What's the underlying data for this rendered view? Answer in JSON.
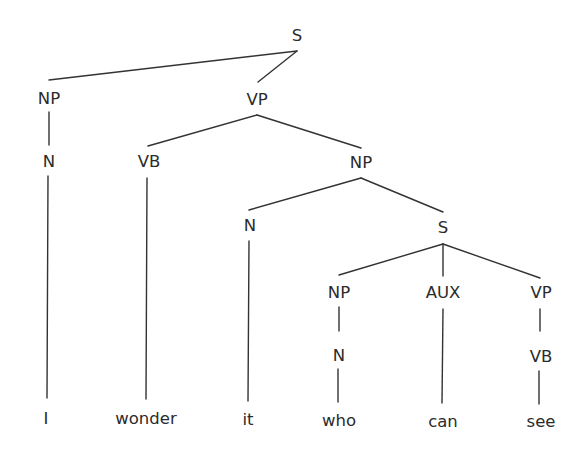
{
  "diagram": {
    "type": "syntax-tree",
    "sentence": "I wonder it who can see",
    "nodes": [
      {
        "id": "s_root",
        "label": "S",
        "x": 297,
        "y": 36,
        "kind": "category"
      },
      {
        "id": "np_1",
        "label": "NP",
        "x": 49,
        "y": 99,
        "kind": "category"
      },
      {
        "id": "vp_1",
        "label": "VP",
        "x": 257,
        "y": 100,
        "kind": "category"
      },
      {
        "id": "n_1",
        "label": "N",
        "x": 49,
        "y": 162,
        "kind": "category"
      },
      {
        "id": "vb_1",
        "label": "VB",
        "x": 149,
        "y": 162,
        "kind": "category"
      },
      {
        "id": "np_2",
        "label": "NP",
        "x": 361,
        "y": 163,
        "kind": "category"
      },
      {
        "id": "n_2",
        "label": "N",
        "x": 250,
        "y": 226,
        "kind": "category"
      },
      {
        "id": "s_sub",
        "label": "S",
        "x": 443,
        "y": 228,
        "kind": "category"
      },
      {
        "id": "np_3",
        "label": "NP",
        "x": 339,
        "y": 293,
        "kind": "category"
      },
      {
        "id": "aux_1",
        "label": "AUX",
        "x": 443,
        "y": 293,
        "kind": "category"
      },
      {
        "id": "vp_2",
        "label": "VP",
        "x": 541,
        "y": 293,
        "kind": "category"
      },
      {
        "id": "n_3",
        "label": "N",
        "x": 339,
        "y": 356,
        "kind": "category"
      },
      {
        "id": "vb_2",
        "label": "VB",
        "x": 541,
        "y": 357,
        "kind": "category"
      },
      {
        "id": "w_i",
        "label": "I",
        "x": 46,
        "y": 419,
        "kind": "word"
      },
      {
        "id": "w_wonder",
        "label": "wonder",
        "x": 146,
        "y": 419,
        "kind": "word"
      },
      {
        "id": "w_it",
        "label": "it",
        "x": 248,
        "y": 420,
        "kind": "word"
      },
      {
        "id": "w_who",
        "label": "who",
        "x": 339,
        "y": 421,
        "kind": "word"
      },
      {
        "id": "w_can",
        "label": "can",
        "x": 443,
        "y": 422,
        "kind": "word"
      },
      {
        "id": "w_see",
        "label": "see",
        "x": 541,
        "y": 422,
        "kind": "word"
      }
    ],
    "edges": [
      {
        "from": "s_root",
        "to": "np_1",
        "x1": 297,
        "y1": 51,
        "x2": 49,
        "y2": 80
      },
      {
        "from": "s_root",
        "to": "vp_1",
        "x1": 297,
        "y1": 51,
        "x2": 258,
        "y2": 82
      },
      {
        "from": "np_1",
        "to": "n_1",
        "x1": 49,
        "y1": 112,
        "x2": 49,
        "y2": 145
      },
      {
        "from": "n_1",
        "to": "w_i",
        "x1": 48,
        "y1": 176,
        "x2": 47,
        "y2": 398
      },
      {
        "from": "vp_1",
        "to": "vb_1",
        "x1": 257,
        "y1": 115,
        "x2": 148,
        "y2": 146
      },
      {
        "from": "vp_1",
        "to": "np_2",
        "x1": 257,
        "y1": 115,
        "x2": 361,
        "y2": 148
      },
      {
        "from": "vb_1",
        "to": "w_wonder",
        "x1": 147,
        "y1": 178,
        "x2": 146,
        "y2": 399
      },
      {
        "from": "np_2",
        "to": "n_2",
        "x1": 361,
        "y1": 178,
        "x2": 249,
        "y2": 210
      },
      {
        "from": "np_2",
        "to": "s_sub",
        "x1": 361,
        "y1": 178,
        "x2": 443,
        "y2": 212
      },
      {
        "from": "n_2",
        "to": "w_it",
        "x1": 249,
        "y1": 241,
        "x2": 248,
        "y2": 401
      },
      {
        "from": "s_sub",
        "to": "np_3",
        "x1": 443,
        "y1": 244,
        "x2": 339,
        "y2": 275
      },
      {
        "from": "s_sub",
        "to": "aux_1",
        "x1": 443,
        "y1": 244,
        "x2": 443,
        "y2": 276
      },
      {
        "from": "s_sub",
        "to": "vp_2",
        "x1": 443,
        "y1": 244,
        "x2": 540,
        "y2": 278
      },
      {
        "from": "np_3",
        "to": "n_3",
        "x1": 339,
        "y1": 307,
        "x2": 339,
        "y2": 331
      },
      {
        "from": "n_3",
        "to": "w_who",
        "x1": 338,
        "y1": 369,
        "x2": 338,
        "y2": 402
      },
      {
        "from": "aux_1",
        "to": "w_can",
        "x1": 443,
        "y1": 309,
        "x2": 442,
        "y2": 403
      },
      {
        "from": "vp_2",
        "to": "vb_2",
        "x1": 540,
        "y1": 309,
        "x2": 540,
        "y2": 331
      },
      {
        "from": "vb_2",
        "to": "w_see",
        "x1": 539,
        "y1": 371,
        "x2": 539,
        "y2": 404
      }
    ],
    "colors": {
      "background": "#ffffff",
      "ink": "#2b2b2b",
      "line": "#333333"
    }
  }
}
